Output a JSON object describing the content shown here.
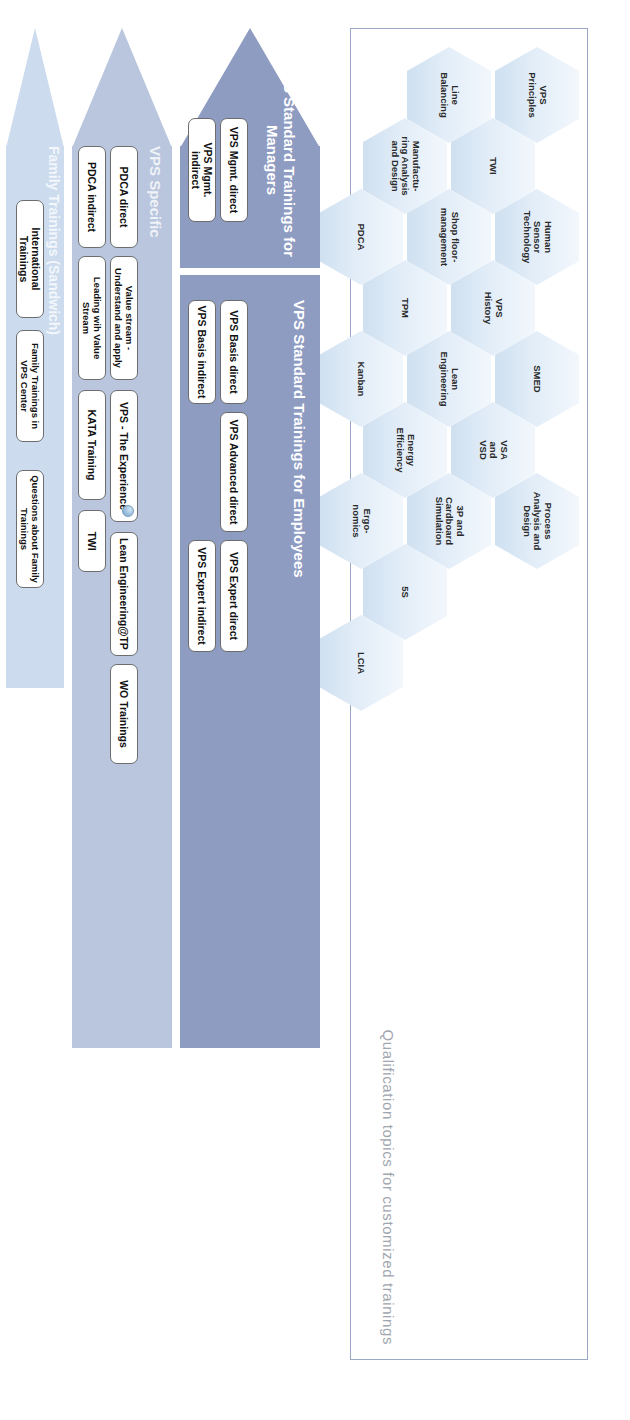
{
  "hex_section": {
    "caption": "Qualification topics for customized trainings",
    "hexagons": [
      {
        "lines": [
          "VPS",
          "Principles"
        ]
      },
      {
        "lines": [
          "Human",
          "Sensor",
          "Technology"
        ]
      },
      {
        "lines": [
          "SMED"
        ]
      },
      {
        "lines": [
          "Process",
          "Analysis and",
          "Design"
        ]
      },
      {
        "lines": [
          "TWI"
        ]
      },
      {
        "lines": [
          "VPS",
          "History"
        ]
      },
      {
        "lines": [
          "VSA",
          "and",
          "VSD"
        ]
      },
      {
        "lines": [
          "Line",
          "Balancing"
        ]
      },
      {
        "lines": [
          "Shop floor-",
          "management"
        ]
      },
      {
        "lines": [
          "Lean",
          "Engineering"
        ]
      },
      {
        "lines": [
          "3P and",
          "Cardboard",
          "Simulation"
        ]
      },
      {
        "lines": [
          "Manufactu-",
          "ring Analysis",
          "and Design"
        ]
      },
      {
        "lines": [
          "TPM"
        ]
      },
      {
        "lines": [
          "Energy",
          "Efficiency"
        ]
      },
      {
        "lines": [
          "5S"
        ]
      },
      {
        "lines": [
          "PDCA"
        ]
      },
      {
        "lines": [
          "Kanban"
        ]
      },
      {
        "lines": [
          "Ergo-",
          "nomics"
        ]
      },
      {
        "lines": [
          "LCIA"
        ]
      }
    ]
  },
  "bands": [
    {
      "id": "managers",
      "title_lines": [
        "VPS Standard Trainings for",
        "Managers"
      ],
      "color": "#8f9cc2",
      "cards": [
        "VPS Mgmt. direct",
        "VPS Mgmt. indirect"
      ]
    },
    {
      "id": "employees",
      "title_lines": [
        "VPS Standard Trainings for Employees"
      ],
      "color": "#8f9cc2",
      "cards": [
        "VPS Basis direct",
        "VPS Basis indirect",
        "VPS Advanced direct",
        "VPS Expert direct",
        "VPS Expert indirect"
      ]
    },
    {
      "id": "vps-specific",
      "title_lines": [
        "VPS Specific"
      ],
      "color": "#b9c6de",
      "cards": [
        "PDCA direct",
        "PDCA indirect",
        "Value stream - Understand and apply",
        "Leading wih Value Stream",
        "VPS - The Experience",
        "Lean Engineering@TP",
        "KATA Training",
        "WO Trainings",
        "TWI"
      ]
    },
    {
      "id": "family-trainings",
      "title_lines": [
        "Family Trainings (Sandwich)"
      ],
      "color": "#ccdcee",
      "cards": [
        "International Trainings",
        "„Learning to See“ 1 – Lean Basics for QMT",
        "Family Trainings in VPS Center",
        "Trainings for external Partners",
        "Questions about Family Trainings"
      ]
    }
  ],
  "cards": {
    "vps_mgmt_direct": "VPS Mgmt. direct",
    "vps_mgmt_indirect": "VPS Mgmt. indirect",
    "vps_basis_direct": "VPS Basis direct",
    "vps_basis_indirect": "VPS Basis indirect",
    "vps_advanced_direct": "VPS Advanced direct",
    "vps_expert_direct": "VPS Expert direct",
    "vps_expert_indirect": "VPS Expert indirect",
    "pdca_direct": "PDCA direct",
    "pdca_indirect": "PDCA indirect",
    "value_stream": "Value stream - Understand and apply",
    "leading_value_stream": "Leading wih Value Stream",
    "vps_experience": "VPS - The Experience",
    "lean_eng_tp": "Lean Engineering@TP",
    "kata_training": "KATA Training",
    "wo_trainings": "WO Trainings",
    "twi": "TWI",
    "international_trainings": "International Trainings",
    "learning_to_see": "„Learning to See“ 1 – Lean Basics for QMT",
    "family_vps_center": "Family Trainings in VPS Center",
    "external_partners": "Trainings for external Partners",
    "questions_family": "Questions about Family Trainings"
  },
  "titles": {
    "managers": "VPS Standard Trainings for Managers",
    "managers_l1": "VPS Standard Trainings for",
    "managers_l2": "Managers",
    "employees": "VPS Standard Trainings for Employees",
    "vps_specific": "VPS Specific",
    "family": "Family Trainings (Sandwich)"
  }
}
